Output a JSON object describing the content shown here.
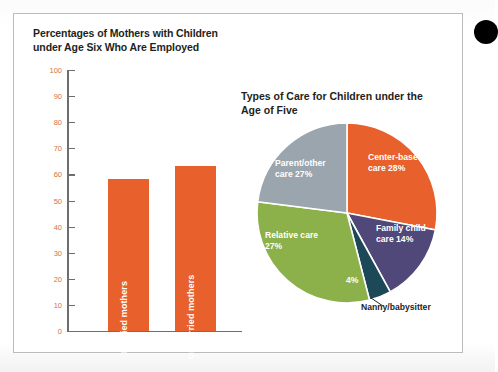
{
  "figure": {
    "corner_marker": "black-dot"
  },
  "bar_chart": {
    "title": "Percentages of Mothers with Children under Age Six Who Are Employed",
    "axis_ticks": [
      "100",
      "90",
      "80",
      "70",
      "60",
      "50",
      "40",
      "30",
      "20",
      "10",
      "0"
    ],
    "bars": [
      {
        "label": "Married mothers",
        "value": 58
      },
      {
        "label": "Unmarried mothers",
        "value": 63
      }
    ],
    "bar_color": "#e8602c",
    "tick_color": "#d2733f",
    "axis_color": "#6d6e71"
  },
  "pie_chart": {
    "title": "Types of Care for Children under the Age of Five",
    "slices": [
      {
        "label": "Center-based care",
        "pct": "28%",
        "value": 28,
        "color": "#e8602c",
        "label_pos": "inside"
      },
      {
        "label": "Family child care",
        "pct": "14%",
        "value": 14,
        "color": "#504878",
        "label_pos": "inside"
      },
      {
        "label": "Nanny/babysitter",
        "pct": "4%",
        "value": 4,
        "color": "#1d4858",
        "label_pos": "outside"
      },
      {
        "label": "Relative care",
        "pct": "27%",
        "value": 27,
        "color": "#8cb04a",
        "label_pos": "inside"
      },
      {
        "label": "Parent/other care",
        "pct": "27%",
        "value": 27,
        "color": "#9aa5ad",
        "label_pos": "inside"
      }
    ]
  },
  "chart_data": [
    {
      "type": "bar",
      "title": "Percentages of Mothers with Children under Age Six Who Are Employed",
      "categories": [
        "Married mothers",
        "Unmarried mothers"
      ],
      "values": [
        58,
        63
      ],
      "xlabel": "",
      "ylabel": "",
      "ylim": [
        0,
        100
      ],
      "yticks": [
        0,
        10,
        20,
        30,
        40,
        50,
        60,
        70,
        80,
        90,
        100
      ],
      "grid": false,
      "legend": "none",
      "series_color": "#e8602c"
    },
    {
      "type": "pie",
      "title": "Types of Care for Children under the Age of Five",
      "categories": [
        "Center-based care",
        "Family child care",
        "Nanny/babysitter",
        "Relative care",
        "Parent/other care"
      ],
      "values": [
        28,
        14,
        4,
        27,
        27
      ],
      "labels": [
        "28%",
        "14%",
        "4%",
        "27%",
        "27%"
      ],
      "colors": [
        "#e8602c",
        "#504878",
        "#1d4858",
        "#8cb04a",
        "#9aa5ad"
      ],
      "legend": "none",
      "start_angle_deg": 0,
      "direction": "clockwise"
    }
  ]
}
